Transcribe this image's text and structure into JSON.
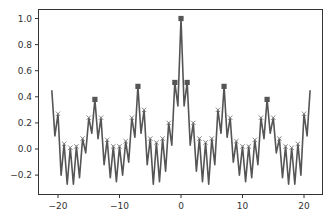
{
  "chart_data": {
    "type": "line",
    "title": "",
    "xlabel": "",
    "ylabel": "",
    "xlim": [
      -22.0,
      24.3
    ],
    "ylim": [
      -0.35,
      1.06
    ],
    "grid": false,
    "legend": null,
    "xticks": [
      -20,
      -10,
      0,
      10,
      20
    ],
    "xtick_labels": [
      "−20",
      "−10",
      "0",
      "10",
      "20"
    ],
    "yticks": [
      -0.2,
      0.0,
      0.2,
      0.4,
      0.6,
      0.8,
      1.0
    ],
    "ytick_labels": [
      "−0.2",
      "0.0",
      "0.2",
      "0.4",
      "0.6",
      "0.8",
      "1.0"
    ],
    "line_color": "#555555",
    "marker_color": "#555555",
    "series": [
      {
        "name": "signal",
        "x": [
          -21,
          -20.5,
          -20,
          -19.5,
          -19,
          -18.5,
          -18,
          -17.5,
          -17,
          -16.5,
          -16,
          -15.5,
          -15,
          -14.5,
          -14,
          -13.5,
          -13,
          -12.5,
          -12,
          -11.5,
          -11,
          -10.5,
          -10,
          -9.5,
          -9,
          -8.5,
          -8,
          -7.5,
          -7,
          -6.5,
          -6,
          -5.5,
          -5,
          -4.5,
          -4,
          -3.5,
          -3,
          -2.5,
          -2,
          -1.5,
          -1,
          -0.5,
          0,
          0.5,
          1,
          1.5,
          2,
          2.5,
          3,
          3.5,
          4,
          4.5,
          5,
          5.5,
          6,
          6.5,
          7,
          7.5,
          8,
          8.5,
          9,
          9.5,
          10,
          10.5,
          11,
          11.5,
          12,
          12.5,
          13,
          13.5,
          14,
          14.5,
          15,
          15.5,
          16,
          16.5,
          17,
          17.5,
          18,
          18.5,
          19,
          19.5,
          20,
          20.5,
          21
        ],
        "y": [
          0.45,
          0.1,
          0.27,
          -0.2,
          0.04,
          -0.27,
          0.01,
          -0.27,
          0.02,
          -0.22,
          0.08,
          -0.03,
          0.24,
          0.12,
          0.38,
          0.08,
          0.24,
          -0.12,
          0.07,
          -0.22,
          0.02,
          -0.25,
          0.02,
          -0.2,
          0.06,
          -0.1,
          0.24,
          0.09,
          0.48,
          0.12,
          0.3,
          -0.12,
          0.08,
          -0.27,
          0.05,
          -0.25,
          0.08,
          -0.17,
          0.2,
          0.03,
          0.51,
          0.33,
          1.0,
          0.33,
          0.51,
          0.03,
          0.2,
          -0.17,
          0.08,
          -0.25,
          0.05,
          -0.27,
          0.08,
          -0.12,
          0.3,
          0.12,
          0.48,
          0.09,
          0.24,
          -0.1,
          0.06,
          -0.2,
          0.02,
          -0.25,
          0.02,
          -0.22,
          0.07,
          -0.12,
          0.24,
          0.08,
          0.38,
          0.12,
          0.24,
          -0.03,
          0.08,
          -0.22,
          0.02,
          -0.27,
          0.01,
          -0.27,
          0.04,
          -0.2,
          0.27,
          0.1,
          0.45
        ]
      }
    ],
    "square_markers": {
      "x": [
        -14,
        -7,
        -1,
        0,
        1,
        7,
        14
      ],
      "y": [
        0.38,
        0.48,
        0.51,
        1.0,
        0.51,
        0.48,
        0.38
      ]
    },
    "x_markers": {
      "x": [
        -20,
        -19,
        -18,
        -17,
        -16,
        -15,
        -13,
        -12,
        -11,
        -10,
        -9,
        -8,
        -6,
        -5,
        -4,
        -3,
        -2,
        2,
        3,
        4,
        5,
        6,
        8,
        9,
        10,
        11,
        12,
        13,
        15,
        16,
        17,
        18,
        19,
        20
      ],
      "y": [
        0.27,
        0.04,
        0.01,
        0.02,
        0.08,
        0.24,
        0.24,
        0.07,
        0.02,
        0.02,
        0.06,
        0.24,
        0.3,
        0.08,
        0.05,
        0.08,
        0.2,
        0.2,
        0.08,
        0.05,
        0.08,
        0.3,
        0.24,
        0.06,
        0.02,
        0.02,
        0.07,
        0.24,
        0.24,
        0.08,
        0.02,
        0.01,
        0.04,
        0.27
      ]
    }
  }
}
